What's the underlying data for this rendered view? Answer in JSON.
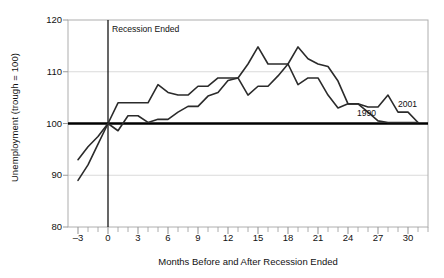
{
  "chart_data": {
    "type": "line",
    "title": "",
    "subtitle": "",
    "xlabel": "Months Before and After Recession Ended",
    "ylabel": "Unemployment (trough = 100)",
    "xlim": [
      -4,
      32
    ],
    "ylim": [
      80,
      120
    ],
    "xticks": [
      -3,
      0,
      3,
      6,
      9,
      12,
      15,
      18,
      21,
      24,
      27,
      30
    ],
    "xtick_labels": [
      "–3",
      "0",
      "3",
      "6",
      "9",
      "12",
      "15",
      "18",
      "21",
      "24",
      "27",
      "30"
    ],
    "yticks": [
      80,
      90,
      100,
      110,
      120
    ],
    "ytick_labels": [
      "80",
      "90",
      "100",
      "110",
      "120"
    ],
    "grid": "horizontal",
    "legend_position": "inline-labels",
    "annotations": [
      {
        "name": "recession-ended-marker",
        "text": "Recession Ended",
        "x": 0,
        "y": 118
      },
      {
        "name": "series-label-1990",
        "text": "1990",
        "x": 26.2,
        "y": 101.8
      },
      {
        "name": "series-label-2001",
        "text": "2001",
        "x": 30.3,
        "y": 103.6
      }
    ],
    "reference_lines": [
      {
        "name": "trough-baseline",
        "orientation": "horizontal",
        "value": 100,
        "color": "#000000",
        "width": 2.4
      },
      {
        "name": "recession-end-line",
        "orientation": "vertical",
        "value": 0,
        "color": "#000000",
        "width": 1.2
      }
    ],
    "x": [
      -3,
      -2,
      -1,
      0,
      1,
      2,
      3,
      4,
      5,
      6,
      7,
      8,
      9,
      10,
      11,
      12,
      13,
      14,
      15,
      16,
      17,
      18,
      19,
      20,
      21,
      22,
      23,
      24,
      25,
      26,
      27,
      28,
      29,
      30,
      31
    ],
    "series": [
      {
        "name": "1990",
        "label": "1990",
        "color": "#2b2b2b",
        "values": [
          93.0,
          95.5,
          97.5,
          100.0,
          104.0,
          104.0,
          104.0,
          104.0,
          107.5,
          106.0,
          105.5,
          105.5,
          107.2,
          107.2,
          108.8,
          108.8,
          108.8,
          105.5,
          107.2,
          107.2,
          109.2,
          111.5,
          107.5,
          108.8,
          108.8,
          105.5,
          103.0,
          103.8,
          103.8,
          102.2,
          100.5,
          100.2,
          100.2,
          100.2,
          100.2
        ]
      },
      {
        "name": "2001",
        "label": "2001",
        "color": "#2b2b2b",
        "values": [
          89.0,
          92.0,
          96.0,
          100.0,
          98.6,
          101.5,
          101.5,
          100.2,
          100.8,
          100.8,
          102.2,
          103.3,
          103.3,
          105.3,
          106.0,
          108.3,
          108.8,
          111.5,
          114.8,
          111.5,
          111.5,
          111.5,
          114.8,
          112.5,
          111.5,
          111.0,
          108.2,
          103.8,
          103.8,
          103.2,
          103.2,
          105.5,
          102.2,
          102.2,
          100.2
        ]
      }
    ]
  }
}
